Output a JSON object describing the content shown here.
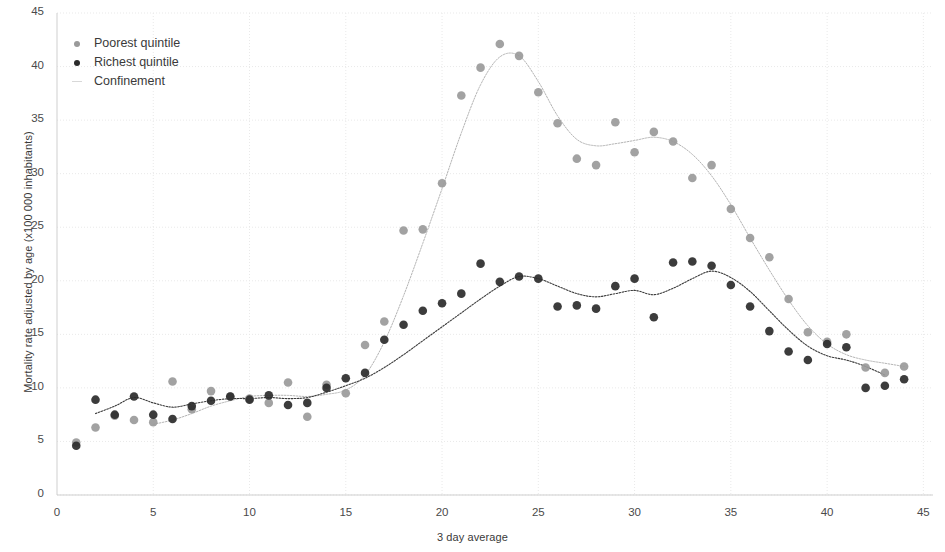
{
  "chart_data": {
    "type": "scatter",
    "title": "",
    "xlabel": "3 day average",
    "ylabel": "Mortality rate adjusted by age (x100 000 inhabitants)",
    "xlim": [
      0,
      45.5
    ],
    "ylim": [
      0,
      45
    ],
    "xticks": [
      0,
      5,
      10,
      15,
      20,
      25,
      30,
      35,
      40,
      45
    ],
    "yticks": [
      0,
      5,
      10,
      15,
      20,
      25,
      30,
      35,
      40,
      45
    ],
    "grid": true,
    "legend_position": "top-left",
    "colors": {
      "poorest": "#9a9a9a",
      "richest": "#2b2b2b",
      "grid": "#e9e9e9",
      "axis": "#cfcfcf"
    },
    "series": [
      {
        "name": "Poorest quintile",
        "marker": "circle",
        "color": "#9a9a9a",
        "x": [
          1,
          2,
          3,
          4,
          5,
          6,
          7,
          8,
          9,
          10,
          11,
          12,
          13,
          14,
          15,
          16,
          17,
          18,
          19,
          20,
          21,
          22,
          23,
          24,
          25,
          26,
          27,
          28,
          29,
          30,
          31,
          32,
          33,
          34,
          35,
          36,
          37,
          38,
          39,
          40,
          41,
          42,
          43,
          44
        ],
        "values": [
          4.9,
          6.3,
          7.4,
          7.0,
          6.8,
          10.6,
          8.0,
          9.7,
          9.2,
          9.0,
          8.6,
          10.5,
          7.3,
          10.3,
          9.5,
          14.0,
          16.2,
          24.7,
          24.8,
          29.1,
          37.3,
          39.9,
          42.1,
          41.0,
          37.6,
          34.7,
          31.4,
          30.8,
          34.8,
          32.0,
          33.9,
          33.0,
          29.6,
          30.8,
          26.7,
          24.0,
          22.2,
          18.3,
          15.2,
          14.3,
          15.0,
          11.9,
          11.4,
          12.0
        ]
      },
      {
        "name": "Richest quintile",
        "marker": "circle",
        "color": "#2b2b2b",
        "x": [
          1,
          2,
          3,
          4,
          5,
          6,
          7,
          8,
          9,
          10,
          11,
          12,
          13,
          14,
          15,
          16,
          17,
          18,
          19,
          20,
          21,
          22,
          23,
          24,
          25,
          26,
          27,
          28,
          29,
          30,
          31,
          32,
          33,
          34,
          35,
          36,
          37,
          38,
          39,
          40,
          41,
          42,
          43,
          44
        ],
        "values": [
          4.6,
          8.9,
          7.5,
          9.2,
          7.5,
          7.1,
          8.3,
          8.8,
          9.2,
          8.9,
          9.3,
          8.4,
          8.6,
          10.0,
          10.9,
          11.4,
          14.5,
          15.9,
          17.2,
          17.9,
          18.8,
          21.6,
          19.9,
          20.4,
          20.2,
          17.6,
          17.7,
          17.4,
          19.5,
          20.2,
          16.6,
          21.7,
          21.8,
          21.4,
          19.6,
          17.6,
          15.3,
          13.4,
          12.6,
          14.1,
          13.8,
          10.0,
          10.2,
          10.8
        ]
      }
    ],
    "trend_lines": [
      {
        "name": "Poorest quintile trend",
        "color": "#b4b4b4",
        "x": [
          5,
          6,
          7,
          8,
          9,
          10,
          11,
          12,
          13,
          14,
          15,
          16,
          17,
          18,
          19,
          20,
          21,
          22,
          23,
          24,
          25,
          26,
          27,
          28,
          29,
          30,
          31,
          32,
          33,
          34,
          35,
          36,
          37,
          38,
          39,
          40,
          41,
          42,
          43,
          44
        ],
        "values": [
          6.6,
          7.0,
          7.6,
          8.3,
          8.8,
          9.2,
          9.3,
          9.3,
          9.2,
          9.4,
          9.8,
          11.2,
          14.3,
          18.6,
          23.5,
          28.6,
          33.8,
          38.3,
          40.9,
          41.0,
          38.6,
          35.4,
          33.2,
          32.6,
          32.8,
          33.1,
          33.4,
          33.0,
          31.8,
          29.8,
          27.1,
          24.0,
          21.0,
          18.2,
          15.8,
          14.1,
          13.1,
          12.6,
          12.3,
          12.0
        ]
      },
      {
        "name": "Richest quintile trend",
        "color": "#3d3d3d",
        "x": [
          2,
          3,
          4,
          5,
          6,
          7,
          8,
          9,
          10,
          11,
          12,
          13,
          14,
          15,
          16,
          17,
          18,
          19,
          20,
          21,
          22,
          23,
          24,
          25,
          26,
          27,
          28,
          29,
          30,
          31,
          32,
          33,
          34,
          35,
          36,
          37,
          38,
          39,
          40,
          41,
          42,
          43
        ],
        "values": [
          7.6,
          8.3,
          9.1,
          8.6,
          8.2,
          8.5,
          8.8,
          9.0,
          9.0,
          9.1,
          9.0,
          9.1,
          9.6,
          10.2,
          10.9,
          11.9,
          13.1,
          14.4,
          15.7,
          17.0,
          18.3,
          19.5,
          20.4,
          20.2,
          19.5,
          18.8,
          18.5,
          18.8,
          19.1,
          18.7,
          19.3,
          20.2,
          20.9,
          20.3,
          19.0,
          17.2,
          15.4,
          13.9,
          13.0,
          12.6,
          12.0,
          11.2
        ]
      }
    ]
  },
  "legend": {
    "items": [
      {
        "label": "Poorest quintile",
        "marker": "dot",
        "color": "#9a9a9a"
      },
      {
        "label": "Richest quintile",
        "marker": "dot",
        "color": "#2b2b2b"
      },
      {
        "label": "Confinement",
        "marker": "line",
        "color": "#d8d8d8"
      }
    ]
  }
}
